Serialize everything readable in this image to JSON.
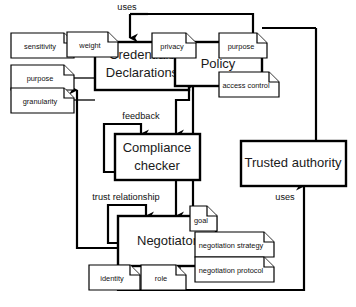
{
  "diagram": {
    "type": "component-relationship-diagram",
    "background_color": "#ffffff",
    "line_color": "#000000",
    "entities": [
      {
        "id": "credentials",
        "label_line1": "Credentials",
        "label_line2": "Declarations"
      },
      {
        "id": "policy",
        "label_line1": "Policy",
        "label_line2": ""
      },
      {
        "id": "compliance",
        "label_line1": "Compliance",
        "label_line2": "checker"
      },
      {
        "id": "negotiator",
        "label_line1": "Negotiator",
        "label_line2": ""
      },
      {
        "id": "trusted_authority",
        "label_line1": "Trusted authority",
        "label_line2": ""
      }
    ],
    "notes": [
      {
        "id": "sensitivity",
        "label": "sensitivity",
        "attached_to": "credentials"
      },
      {
        "id": "weight",
        "label": "weight",
        "attached_to": "credentials"
      },
      {
        "id": "purpose_cred",
        "label": "purpose",
        "attached_to": "credentials"
      },
      {
        "id": "granularity",
        "label": "granularity",
        "attached_to": "credentials"
      },
      {
        "id": "privacy",
        "label": "privacy",
        "attached_to": "policy"
      },
      {
        "id": "purpose_policy",
        "label": "purpose",
        "attached_to": "policy"
      },
      {
        "id": "access_control",
        "label": "access control",
        "attached_to": "policy"
      },
      {
        "id": "goal",
        "label": "goal",
        "attached_to": "negotiator"
      },
      {
        "id": "negotiation_strategy",
        "label": "negotiation strategy",
        "attached_to": "negotiator"
      },
      {
        "id": "negotiation_protocol",
        "label": "negotiation protocol",
        "attached_to": "negotiator"
      },
      {
        "id": "identity",
        "label": "identity",
        "attached_to": "negotiator"
      },
      {
        "id": "role",
        "label": "role",
        "attached_to": "negotiator"
      }
    ],
    "edge_labels": [
      {
        "id": "uses_top",
        "label": "uses"
      },
      {
        "id": "feedback",
        "label": "feedback"
      },
      {
        "id": "trust_relationship",
        "label": "trust relationship"
      },
      {
        "id": "uses_right",
        "label": "uses"
      }
    ]
  }
}
